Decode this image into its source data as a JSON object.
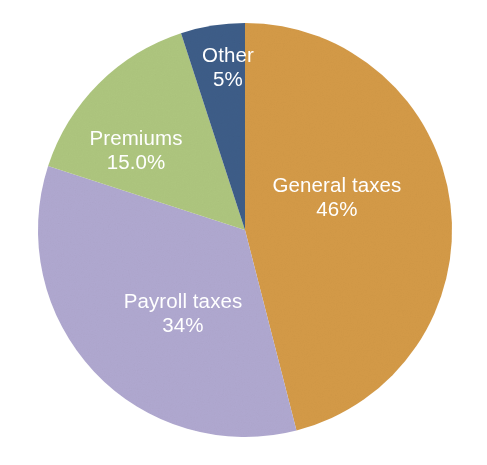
{
  "chart_data": {
    "type": "pie",
    "title": "",
    "subtitle": "",
    "xlabel": "",
    "ylabel": "",
    "legend_position": "none",
    "grid": false,
    "label_style": "inside-slice",
    "start_angle_deg": 0,
    "direction": "clockwise",
    "categories": [
      "General taxes",
      "Payroll taxes",
      "Premiums",
      "Other"
    ],
    "values": [
      46,
      34,
      15.0,
      5
    ],
    "value_labels": [
      "46%",
      "34%",
      "15.0%",
      "5%"
    ],
    "colors": [
      "#D49A47",
      "#B0A8D0",
      "#AEC67E",
      "#3D5D88"
    ],
    "slices": [
      {
        "name": "General taxes",
        "value": 46,
        "value_label": "46%",
        "color": "#D49A47",
        "label_color": "#FFFFFF",
        "label_x": 337,
        "label_y": 192,
        "value_x": 337,
        "value_y": 216
      },
      {
        "name": "Payroll taxes",
        "value": 34,
        "value_label": "34%",
        "color": "#B0A8D0",
        "label_color": "#FFFFFF",
        "label_x": 183,
        "label_y": 308,
        "value_x": 183,
        "value_y": 332
      },
      {
        "name": "Premiums",
        "value": 15.0,
        "value_label": "15.0%",
        "color": "#AEC67E",
        "label_color": "#FFFFFF",
        "label_x": 136,
        "label_y": 145,
        "value_x": 136,
        "value_y": 169
      },
      {
        "name": "Other",
        "value": 5,
        "value_label": "5%",
        "color": "#3D5D88",
        "label_color": "#FFFFFF",
        "label_x": 228,
        "label_y": 62,
        "value_x": 228,
        "value_y": 86
      }
    ]
  },
  "figure": {
    "background_color": "#FFFFFF",
    "center_x": 245,
    "center_y": 230,
    "radius": 207
  }
}
